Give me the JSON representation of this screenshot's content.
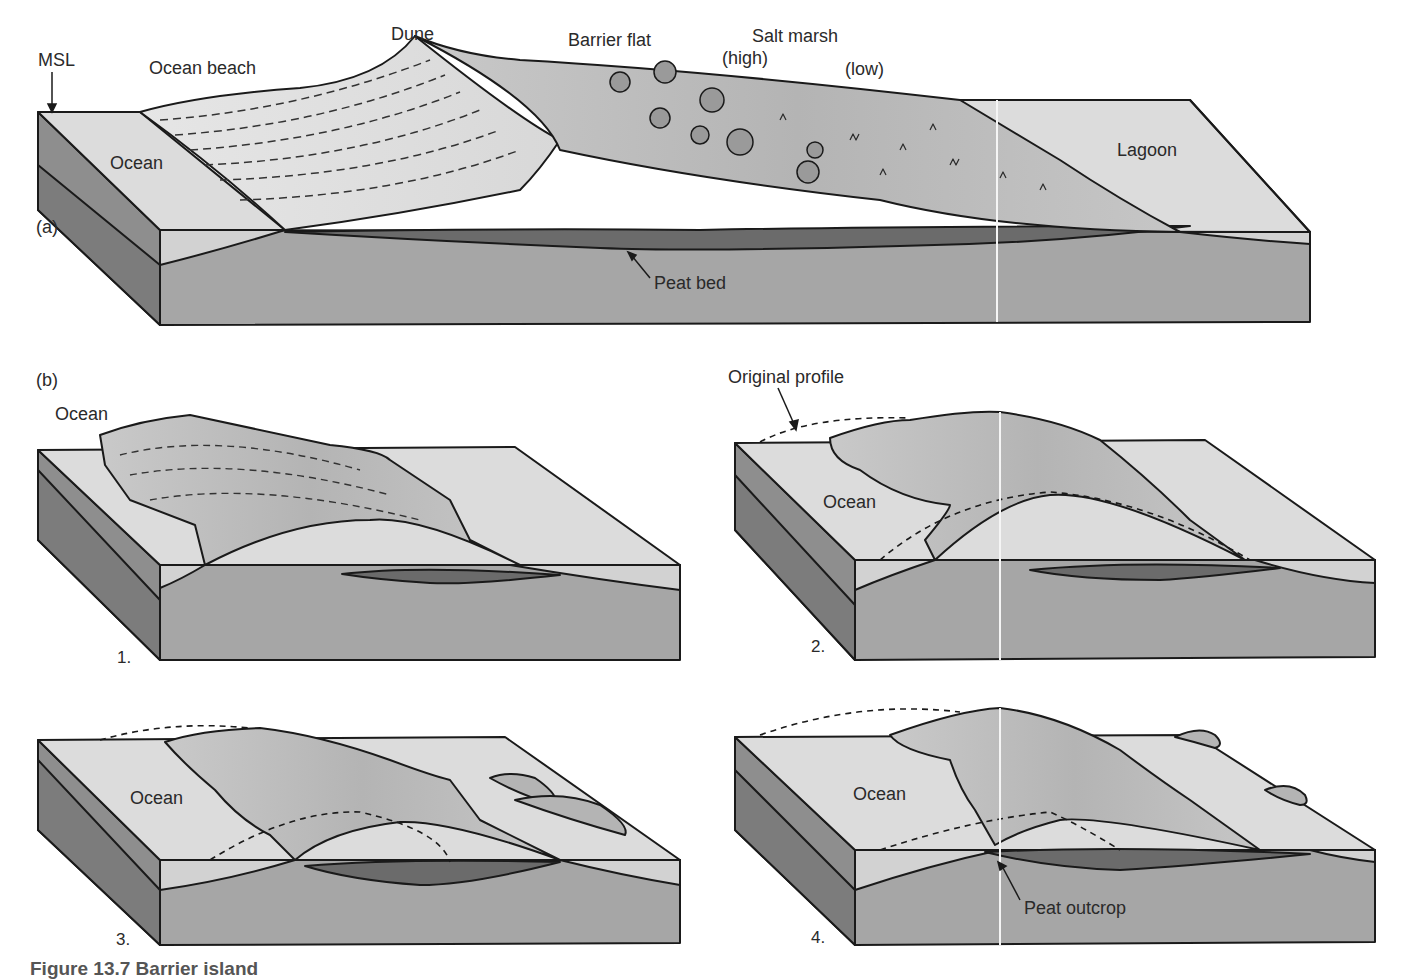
{
  "figure": {
    "caption": "Figure 13.7 Barrier island",
    "colors": {
      "top_surface": "#dcdcdc",
      "barrier_surface": "#b9b9b9",
      "front_face_sand": "#d2d2d2",
      "front_face_substrate": "#a6a6a6",
      "side_face": "#8e8e8e",
      "side_face_dark": "#7c7c7c",
      "peat": "#6b6b6b",
      "outline": "#1a1a1a"
    }
  },
  "panel_a": {
    "tag": "(a)",
    "labels": {
      "msl": "MSL",
      "ocean_beach": "Ocean beach",
      "dune": "Dune",
      "barrier_flat": "Barrier flat",
      "salt_marsh": "Salt marsh",
      "salt_marsh_high": "(high)",
      "salt_marsh_low": "(low)",
      "ocean": "Ocean",
      "lagoon": "Lagoon",
      "peat_bed": "Peat bed"
    }
  },
  "panel_b": {
    "tag": "(b)",
    "stages": [
      {
        "number": "1.",
        "labels": {
          "ocean": "Ocean"
        }
      },
      {
        "number": "2.",
        "labels": {
          "ocean": "Ocean",
          "original_profile": "Original profile"
        }
      },
      {
        "number": "3.",
        "labels": {
          "ocean": "Ocean"
        }
      },
      {
        "number": "4.",
        "labels": {
          "ocean": "Ocean",
          "peat_outcrop": "Peat outcrop"
        }
      }
    ]
  }
}
